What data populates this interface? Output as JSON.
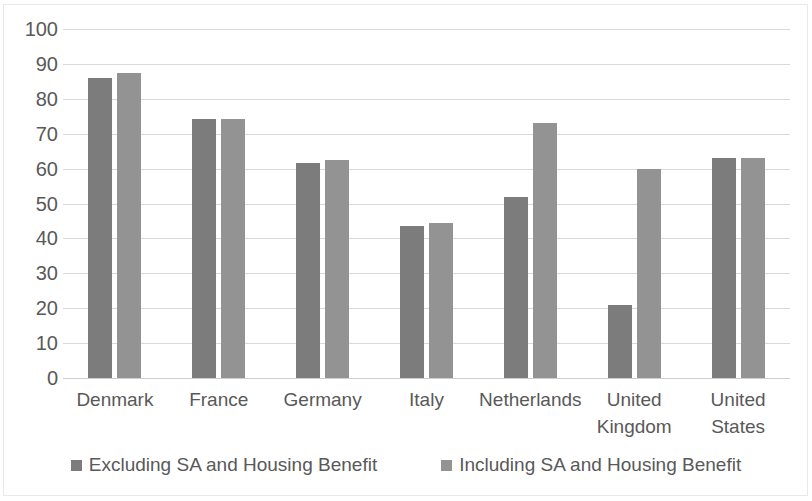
{
  "chart_data": {
    "type": "bar",
    "title": "",
    "subtitle": "",
    "xlabel": "",
    "ylabel": "",
    "ylim": [
      0,
      100
    ],
    "ytick_step": 10,
    "ytick_labels": [
      "100",
      "90",
      "80",
      "70",
      "60",
      "50",
      "40",
      "30",
      "20",
      "10",
      "0"
    ],
    "grid": "horizontal",
    "legend_position": "bottom-center",
    "categories": [
      "Denmark",
      "France",
      "Germany",
      "Italy",
      "Netherlands",
      "United\nKingdom",
      "United\nStates"
    ],
    "series": [
      {
        "name": "Excluding SA and Housing Benefit",
        "color": "#7c7c7c",
        "values": [
          86,
          74.3,
          61.5,
          43.5,
          52,
          21,
          63
        ]
      },
      {
        "name": "Including SA and Housing Benefit",
        "color": "#939393",
        "values": [
          87.5,
          74.3,
          62.5,
          44.5,
          73,
          60,
          63
        ]
      }
    ]
  },
  "styles": {
    "gridline_color": "#d9d9d9",
    "axis_text_color": "#595959",
    "background": "#ffffff",
    "border_color": "#e9e9e9"
  }
}
